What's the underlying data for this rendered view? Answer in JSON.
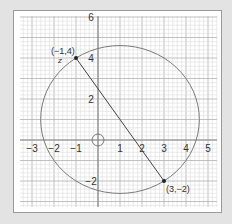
{
  "diagram": {
    "type": "coordinate-plane-circle",
    "colors": {
      "background": "#e3e3e3",
      "panel": "#ffffff",
      "panel_border": "#9a9a9a",
      "grid_minor": "#dcdcdc",
      "grid_major": "#b9b9b9",
      "axis": "#8a8a8a",
      "curve": "#7a7a7a",
      "segment": "#444444",
      "point": "#222222",
      "text": "#333333"
    },
    "x_axis": {
      "ticks": [
        "-3",
        "-2",
        "-1",
        "1",
        "2",
        "3",
        "4",
        "5"
      ],
      "tick_values": [
        -3,
        -2,
        -1,
        1,
        2,
        3,
        4,
        5
      ]
    },
    "y_axis": {
      "ticks": [
        "6",
        "4",
        "2",
        "-2"
      ],
      "tick_values": [
        6,
        4,
        2,
        -2
      ]
    },
    "points": [
      {
        "label": "(−1,4)",
        "x": -1,
        "y": 4,
        "sublabel": "z"
      },
      {
        "label": "(3,−2)",
        "x": 3,
        "y": -2
      }
    ],
    "segment": {
      "from": [
        -1,
        4
      ],
      "to": [
        3,
        -2
      ]
    },
    "circle": {
      "center": [
        1,
        1
      ],
      "radius": 3.606
    },
    "small_circle": {
      "center": [
        0,
        0
      ],
      "radius": 0.28
    }
  }
}
